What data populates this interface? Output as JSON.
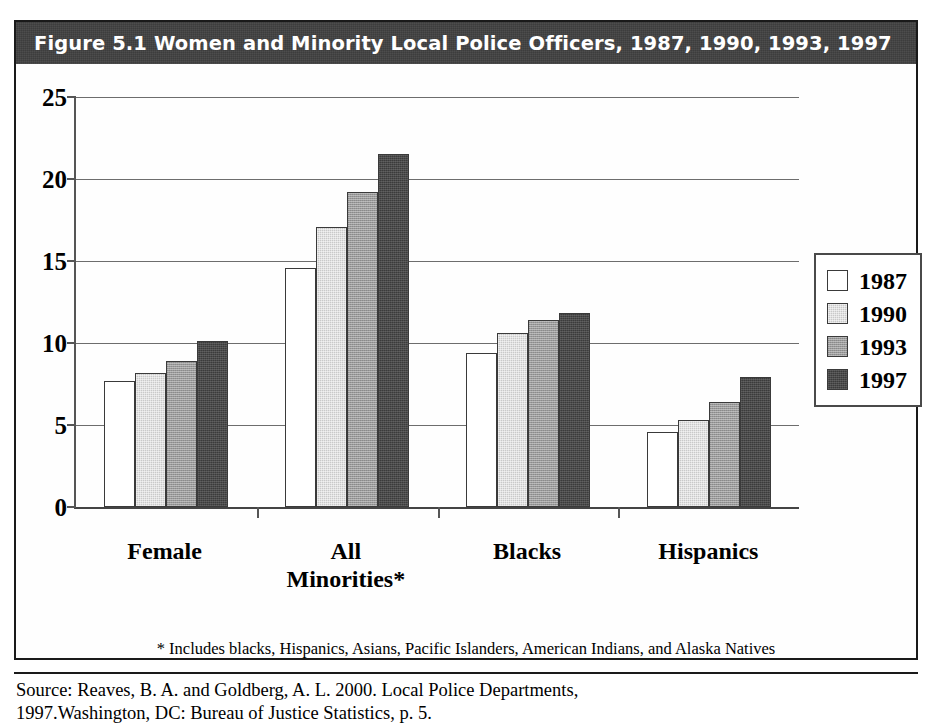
{
  "figure": {
    "title": "Figure 5.1   Women and Minority Local Police Officers, 1987, 1990, 1993, 1997",
    "footnote": "* Includes blacks, Hispanics, Asians, Pacific Islanders, American Indians, and Alaska Natives",
    "source_line1": "Source: Reaves, B. A. and Goldberg, A. L. 2000. Local Police Departments,",
    "source_line2": "1997.Washington, DC: Bureau of Justice Statistics, p. 5."
  },
  "colors": {
    "title_band": "#3d3d3d",
    "title_text": "#ffffff",
    "frame": "#1a1a1a",
    "series_1987": "#ffffff",
    "series_1990": "#c9c9c9",
    "series_1993": "#9a9a9a",
    "series_1997": "#3b3b3b",
    "gridline": "#6d6d6d"
  },
  "legend": {
    "position": "right",
    "entries": [
      {
        "label": "1987",
        "swatch": "white"
      },
      {
        "label": "1990",
        "swatch": "light-gray"
      },
      {
        "label": "1993",
        "swatch": "medium-gray"
      },
      {
        "label": "1997",
        "swatch": "dark-gray"
      }
    ]
  },
  "chart_data": {
    "type": "bar",
    "title": "Figure 5.1   Women and Minority Local Police Officers, 1987, 1990, 1993, 1997",
    "xlabel": "",
    "ylabel": "",
    "ylim": [
      0,
      25
    ],
    "yticks": [
      0,
      5,
      10,
      15,
      20,
      25
    ],
    "ytick_labels": [
      "0",
      "5",
      "10",
      "15",
      "20",
      "25"
    ],
    "grid": true,
    "legend_position": "right",
    "categories": [
      "Female",
      "All Minorities*",
      "Blacks",
      "Hispanics"
    ],
    "series": [
      {
        "name": "1987",
        "values": [
          7.7,
          14.6,
          9.4,
          4.6
        ]
      },
      {
        "name": "1990",
        "values": [
          8.2,
          17.1,
          10.6,
          5.3
        ]
      },
      {
        "name": "1993",
        "values": [
          8.9,
          19.2,
          11.4,
          6.4
        ]
      },
      {
        "name": "1997",
        "values": [
          10.1,
          21.5,
          11.8,
          7.9
        ]
      }
    ],
    "annotations": [
      "* Includes blacks, Hispanics, Asians, Pacific Islanders, American Indians, and Alaska Natives"
    ]
  }
}
